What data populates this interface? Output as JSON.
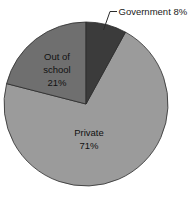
{
  "chart_data": {
    "type": "pie",
    "title": "",
    "subtitle": "",
    "xlabel": "",
    "ylabel": "",
    "legend_position": "none",
    "grid": false,
    "start_angle_deg": 0,
    "direction": "clockwise",
    "categories": [
      "Government",
      "Private",
      "Out of school"
    ],
    "values": [
      8,
      71,
      21
    ],
    "unit": "%",
    "slices": [
      {
        "name": "Government",
        "value": 8,
        "label_line1": "Government 8%",
        "label_text": "Government 8%",
        "percent_text": "8%",
        "color": "#3b3b3b",
        "label_placement": "callout",
        "start_deg": 0,
        "end_deg": 28.8
      },
      {
        "name": "Private",
        "value": 71,
        "label_line1": "Private",
        "label_line2": "71%",
        "label_text": "Private 71%",
        "percent_text": "71%",
        "color": "#9b9b9b",
        "label_placement": "inside",
        "start_deg": 28.8,
        "end_deg": 284.4
      },
      {
        "name": "Out of school",
        "value": 21,
        "label_line1": "Out of",
        "label_line2": "school",
        "label_line3": "21%",
        "label_text": "Out of school 21%",
        "percent_text": "21%",
        "color": "#6f6f6f",
        "label_placement": "inside",
        "start_deg": 284.4,
        "end_deg": 360
      }
    ],
    "colors": {
      "background": "#ffffff",
      "government": "#3b3b3b",
      "private": "#9b9b9b",
      "out_of_school": "#6f6f6f",
      "outline": "#2b2b2b",
      "text": "#111111"
    }
  }
}
